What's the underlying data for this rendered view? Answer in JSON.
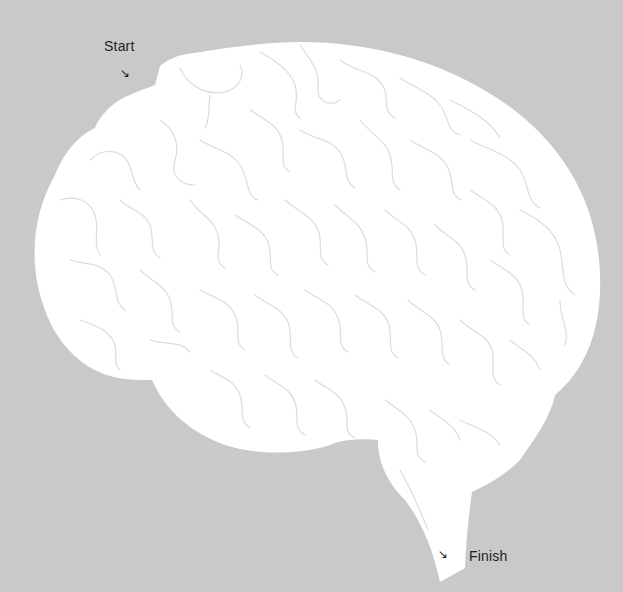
{
  "maze": {
    "title": "Brain maze",
    "start_label": "Start",
    "finish_label": "Finish",
    "start_arrow_icon": "↘",
    "finish_arrow_icon": "↘",
    "colors": {
      "background": "#c9c9c9",
      "brain_fill": "#ffffff",
      "wall_stroke": "#dcdcdc",
      "text": "#1e1e1e"
    }
  }
}
